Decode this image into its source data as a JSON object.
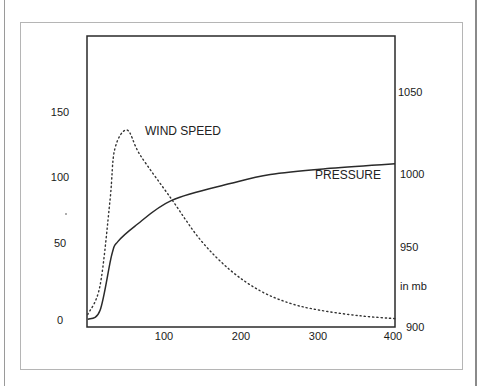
{
  "figure": {
    "top_text_cut": "...",
    "series_labels": {
      "wind": "WIND SPEED",
      "pressure": "PRESSURE"
    },
    "right_axis_unit": "in mb",
    "left_ticks": [
      "0",
      "50",
      "100",
      "150"
    ],
    "right_ticks": [
      "900",
      "950",
      "1000",
      "1050"
    ],
    "x_ticks": [
      "100",
      "200",
      "300",
      "400"
    ]
  },
  "chart_data": {
    "type": "line",
    "title": "",
    "xlabel": "",
    "ylabel": "",
    "ylabel_right": "in mb",
    "xlim": [
      0,
      400
    ],
    "ylim": [
      0,
      200
    ],
    "ylim_right": [
      900,
      1090
    ],
    "grid": false,
    "legend": "inline labels",
    "x_ticks": [
      100,
      200,
      300,
      400
    ],
    "y_ticks_left": [
      0,
      50,
      100,
      150
    ],
    "y_ticks_right": [
      900,
      950,
      1000,
      1050
    ],
    "series": [
      {
        "name": "WIND SPEED",
        "axis": "left",
        "style": "dotted",
        "x": [
          1,
          17,
          30,
          36,
          52,
          69,
          110,
          147,
          186,
          225,
          264,
          303,
          355,
          400
        ],
        "values": [
          4,
          25,
          87,
          123,
          137,
          119,
          87,
          58,
          36,
          21,
          12,
          7,
          3,
          1
        ]
      },
      {
        "name": "PRESSURE",
        "axis": "right",
        "style": "solid",
        "x": [
          1,
          17,
          32,
          40,
          62,
          110,
          186,
          238,
          316,
          400
        ],
        "values": [
          901,
          907,
          943,
          952,
          962,
          979,
          990,
          996,
          1000,
          1003
        ]
      }
    ]
  }
}
